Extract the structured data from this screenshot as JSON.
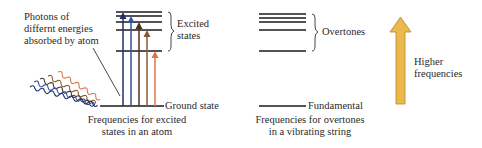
{
  "atom": {
    "photon_label_lines": [
      "Photons of",
      "differnt energies",
      "absorbed by atom"
    ],
    "excited_label_lines": [
      "Excited",
      "states"
    ],
    "ground_label": "Ground state",
    "caption_lines": [
      "Frequencies for excited",
      "states in an atom"
    ],
    "arrow_colors": [
      "#1f2f6b",
      "#3a4f9a",
      "#4a3320",
      "#8a5a35",
      "#e0734a"
    ]
  },
  "string": {
    "overtones_label": "Overtones",
    "fundamental_label": "Fundamental",
    "caption_lines": [
      "Frequencies for overtones",
      "in a vibrating string"
    ]
  },
  "legend": {
    "label_lines": [
      "Higher",
      "frequencies"
    ],
    "arrow_color": "#e9b94c"
  }
}
